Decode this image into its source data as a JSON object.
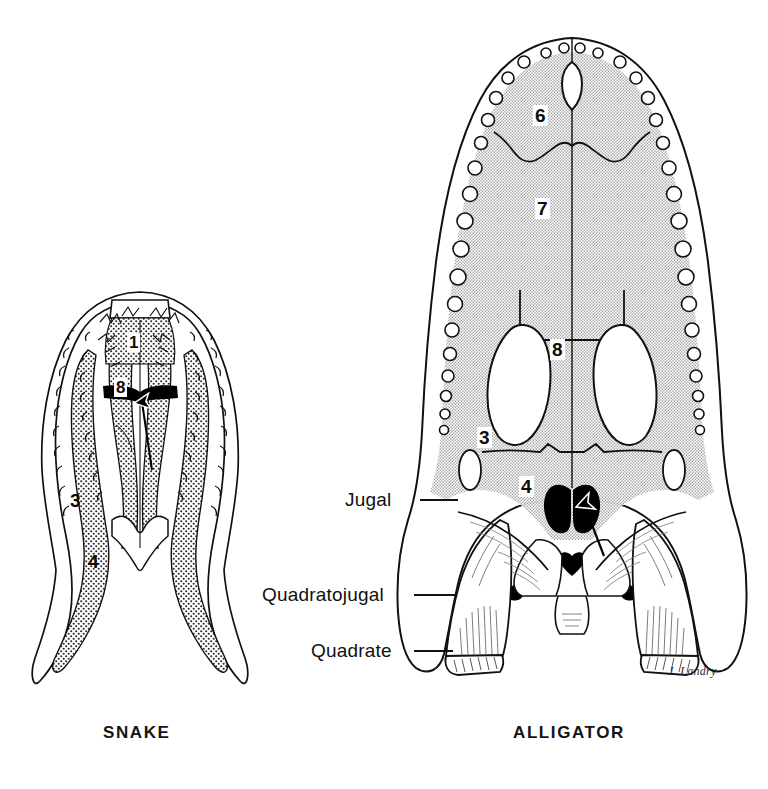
{
  "figure": {
    "type": "comparative-anatomy-illustration",
    "background_color": "#ffffff",
    "ink_color": "#111111",
    "shading_color": "#d3d3d3",
    "signature": "J. Landry"
  },
  "captions": {
    "snake": "SNAKE",
    "alligator": "ALLIGATOR"
  },
  "callouts": [
    {
      "label": "Jugal",
      "target": "alligator",
      "leader_from_x": 420,
      "leader_to_x": 455,
      "leader_y": 500
    },
    {
      "label": "Quadratojugal",
      "target": "alligator",
      "leader_from_x": 414,
      "leader_to_x": 455,
      "leader_y": 595
    },
    {
      "label": "Quadrate",
      "target": "alligator",
      "leader_from_x": 414,
      "leader_to_x": 455,
      "leader_y": 651
    }
  ],
  "snake_numbers": [
    {
      "text": "1",
      "x": 127,
      "y": 333
    },
    {
      "text": "8",
      "x": 114,
      "y": 378
    },
    {
      "text": "3",
      "x": 68,
      "y": 490
    },
    {
      "text": "4",
      "x": 86,
      "y": 551
    }
  ],
  "alligator_numbers": [
    {
      "text": "6",
      "x": 533,
      "y": 105
    },
    {
      "text": "7",
      "x": 535,
      "y": 198
    },
    {
      "text": "8",
      "x": 550,
      "y": 339
    },
    {
      "text": "3",
      "x": 477,
      "y": 427
    },
    {
      "text": "4",
      "x": 519,
      "y": 476
    }
  ],
  "legend_note": {
    "snake_shading": "stipple",
    "alligator_shading": "flat light gray",
    "arrow_count": 2,
    "arrow_description": "arrow pointing to internal naris / choana in each skull"
  }
}
